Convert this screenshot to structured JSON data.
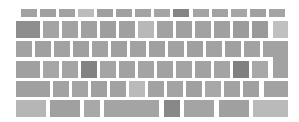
{
  "keyboard": {
    "colors": {
      "default": "#9e9e9e",
      "light": "#b8b8b8",
      "dark": "#7e7e7e",
      "medium": "#a8a8a8"
    },
    "rows": [
      {
        "name": "function-row",
        "keys": [
          {
            "x": 21,
            "y": 9,
            "w": 16,
            "h": 8,
            "c": "#a2a2a2"
          },
          {
            "x": 40,
            "y": 9,
            "w": 16,
            "h": 8,
            "c": "#a0a0a0"
          },
          {
            "x": 59,
            "y": 9,
            "w": 16,
            "h": 8,
            "c": "#a2a2a2"
          },
          {
            "x": 78,
            "y": 9,
            "w": 16,
            "h": 8,
            "c": "#bcbcbc"
          },
          {
            "x": 97,
            "y": 9,
            "w": 16,
            "h": 8,
            "c": "#a0a0a0"
          },
          {
            "x": 116,
            "y": 9,
            "w": 16,
            "h": 8,
            "c": "#a0a0a0"
          },
          {
            "x": 135,
            "y": 9,
            "w": 16,
            "h": 8,
            "c": "#a2a2a2"
          },
          {
            "x": 154,
            "y": 9,
            "w": 16,
            "h": 8,
            "c": "#a4a4a4"
          },
          {
            "x": 173,
            "y": 9,
            "w": 16,
            "h": 8,
            "c": "#858585"
          },
          {
            "x": 193,
            "y": 9,
            "w": 16,
            "h": 8,
            "c": "#a4a4a4"
          },
          {
            "x": 212,
            "y": 9,
            "w": 16,
            "h": 8,
            "c": "#a2a2a2"
          },
          {
            "x": 231,
            "y": 9,
            "w": 16,
            "h": 8,
            "c": "#a6a6a6"
          },
          {
            "x": 250,
            "y": 9,
            "w": 16,
            "h": 8,
            "c": "#a0a0a0"
          },
          {
            "x": 269,
            "y": 9,
            "w": 16,
            "h": 8,
            "c": "#a4a4a4"
          }
        ]
      },
      {
        "name": "number-row",
        "keys": [
          {
            "x": 16,
            "y": 21,
            "w": 24,
            "h": 17,
            "c": "#8e8e8e"
          },
          {
            "x": 43,
            "y": 21,
            "w": 16,
            "h": 17,
            "c": "#a4a4a4"
          },
          {
            "x": 62,
            "y": 21,
            "w": 16,
            "h": 17,
            "c": "#a2a2a2"
          },
          {
            "x": 81,
            "y": 21,
            "w": 16,
            "h": 17,
            "c": "#a0a0a0"
          },
          {
            "x": 100,
            "y": 21,
            "w": 16,
            "h": 17,
            "c": "#9e9e9e"
          },
          {
            "x": 119,
            "y": 21,
            "w": 16,
            "h": 17,
            "c": "#a0a0a0"
          },
          {
            "x": 138,
            "y": 21,
            "w": 16,
            "h": 17,
            "c": "#b8b8b8"
          },
          {
            "x": 157,
            "y": 21,
            "w": 16,
            "h": 17,
            "c": "#a2a2a2"
          },
          {
            "x": 176,
            "y": 21,
            "w": 16,
            "h": 17,
            "c": "#a0a0a0"
          },
          {
            "x": 195,
            "y": 21,
            "w": 16,
            "h": 17,
            "c": "#a2a2a2"
          },
          {
            "x": 214,
            "y": 21,
            "w": 16,
            "h": 17,
            "c": "#a0a0a0"
          },
          {
            "x": 233,
            "y": 21,
            "w": 16,
            "h": 17,
            "c": "#9c9c9c"
          },
          {
            "x": 252,
            "y": 21,
            "w": 16,
            "h": 17,
            "c": "#9a9a9a"
          },
          {
            "x": 273,
            "y": 21,
            "w": 15,
            "h": 17,
            "c": "#c0c0c0"
          }
        ]
      },
      {
        "name": "top-letter-row",
        "keys": [
          {
            "x": 16,
            "y": 41,
            "w": 16,
            "h": 16,
            "c": "#a2a2a2"
          },
          {
            "x": 35,
            "y": 41,
            "w": 16,
            "h": 16,
            "c": "#a0a0a0"
          },
          {
            "x": 54,
            "y": 41,
            "w": 16,
            "h": 16,
            "c": "#a2a2a2"
          },
          {
            "x": 73,
            "y": 41,
            "w": 16,
            "h": 16,
            "c": "#a0a0a0"
          },
          {
            "x": 92,
            "y": 41,
            "w": 16,
            "h": 16,
            "c": "#a2a2a2"
          },
          {
            "x": 111,
            "y": 41,
            "w": 16,
            "h": 16,
            "c": "#a0a0a0"
          },
          {
            "x": 130,
            "y": 41,
            "w": 16,
            "h": 16,
            "c": "#a2a2a2"
          },
          {
            "x": 149,
            "y": 41,
            "w": 16,
            "h": 16,
            "c": "#a0a0a0"
          },
          {
            "x": 168,
            "y": 41,
            "w": 16,
            "h": 16,
            "c": "#a2a2a2"
          },
          {
            "x": 187,
            "y": 41,
            "w": 16,
            "h": 16,
            "c": "#a0a0a0"
          },
          {
            "x": 206,
            "y": 41,
            "w": 16,
            "h": 16,
            "c": "#a2a2a2"
          },
          {
            "x": 225,
            "y": 41,
            "w": 16,
            "h": 16,
            "c": "#a0a0a0"
          },
          {
            "x": 244,
            "y": 41,
            "w": 16,
            "h": 16,
            "c": "#a2a2a2"
          }
        ]
      },
      {
        "name": "home-row",
        "keys": [
          {
            "x": 16,
            "y": 61,
            "w": 24,
            "h": 17,
            "c": "#a0a0a0"
          },
          {
            "x": 43,
            "y": 61,
            "w": 16,
            "h": 17,
            "c": "#a6a6a6"
          },
          {
            "x": 62,
            "y": 61,
            "w": 16,
            "h": 17,
            "c": "#a4a4a4"
          },
          {
            "x": 81,
            "y": 61,
            "w": 16,
            "h": 17,
            "c": "#828282"
          },
          {
            "x": 100,
            "y": 61,
            "w": 16,
            "h": 17,
            "c": "#a4a4a4"
          },
          {
            "x": 119,
            "y": 61,
            "w": 16,
            "h": 17,
            "c": "#a2a2a2"
          },
          {
            "x": 138,
            "y": 61,
            "w": 16,
            "h": 17,
            "c": "#a4a4a4"
          },
          {
            "x": 157,
            "y": 61,
            "w": 16,
            "h": 17,
            "c": "#a2a2a2"
          },
          {
            "x": 176,
            "y": 61,
            "w": 16,
            "h": 17,
            "c": "#a4a4a4"
          },
          {
            "x": 195,
            "y": 61,
            "w": 16,
            "h": 17,
            "c": "#a2a2a2"
          },
          {
            "x": 214,
            "y": 61,
            "w": 16,
            "h": 17,
            "c": "#a4a4a4"
          },
          {
            "x": 233,
            "y": 61,
            "w": 16,
            "h": 17,
            "c": "#808080"
          },
          {
            "x": 252,
            "y": 61,
            "w": 16,
            "h": 17,
            "c": "#a8a8a8"
          }
        ]
      },
      {
        "name": "shift-row",
        "keys": [
          {
            "x": 16,
            "y": 81,
            "w": 34,
            "h": 16,
            "c": "#a0a0a0"
          },
          {
            "x": 53,
            "y": 81,
            "w": 16,
            "h": 16,
            "c": "#a2a2a2"
          },
          {
            "x": 72,
            "y": 81,
            "w": 16,
            "h": 16,
            "c": "#a4a4a4"
          },
          {
            "x": 91,
            "y": 81,
            "w": 16,
            "h": 16,
            "c": "#a0a0a0"
          },
          {
            "x": 110,
            "y": 81,
            "w": 16,
            "h": 16,
            "c": "#a2a2a2"
          },
          {
            "x": 129,
            "y": 81,
            "w": 16,
            "h": 16,
            "c": "#bababa"
          },
          {
            "x": 148,
            "y": 81,
            "w": 16,
            "h": 16,
            "c": "#a2a2a2"
          },
          {
            "x": 167,
            "y": 81,
            "w": 16,
            "h": 16,
            "c": "#a4a4a4"
          },
          {
            "x": 186,
            "y": 81,
            "w": 16,
            "h": 16,
            "c": "#a0a0a0"
          },
          {
            "x": 205,
            "y": 81,
            "w": 16,
            "h": 16,
            "c": "#a8a8a8"
          },
          {
            "x": 224,
            "y": 81,
            "w": 16,
            "h": 16,
            "c": "#a2a2a2"
          },
          {
            "x": 243,
            "y": 81,
            "w": 16,
            "h": 16,
            "c": "#a0a0a0"
          },
          {
            "x": 264,
            "y": 81,
            "w": 24,
            "h": 16,
            "c": "#a2a2a2"
          }
        ]
      },
      {
        "name": "bottom-row",
        "keys": [
          {
            "x": 16,
            "y": 100,
            "w": 30,
            "h": 17,
            "c": "#b6b6b6"
          },
          {
            "x": 50,
            "y": 100,
            "w": 30,
            "h": 17,
            "c": "#a0a0a0"
          },
          {
            "x": 84,
            "y": 100,
            "w": 16,
            "h": 17,
            "c": "#a8a8a8"
          },
          {
            "x": 104,
            "y": 100,
            "w": 55,
            "h": 17,
            "c": "#a4a4a4"
          },
          {
            "x": 164,
            "y": 100,
            "w": 16,
            "h": 17,
            "c": "#888888"
          },
          {
            "x": 184,
            "y": 100,
            "w": 30,
            "h": 17,
            "c": "#a4a4a4"
          },
          {
            "x": 219,
            "y": 100,
            "w": 30,
            "h": 17,
            "c": "#a0a0a0"
          },
          {
            "x": 253,
            "y": 100,
            "w": 35,
            "h": 17,
            "c": "#bababa"
          }
        ]
      }
    ],
    "enter_key": {
      "top": {
        "x": 263,
        "y": 41,
        "w": 25,
        "h": 16,
        "c": "#a2a2a2"
      },
      "bottom": {
        "x": 273,
        "y": 57,
        "w": 15,
        "h": 21,
        "c": "#a2a2a2"
      }
    }
  }
}
